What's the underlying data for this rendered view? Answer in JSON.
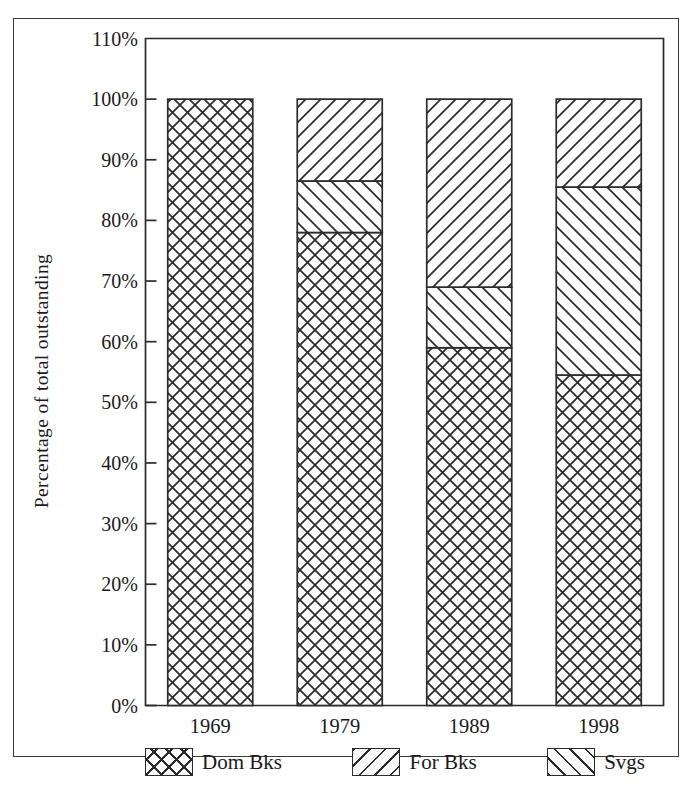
{
  "chart_data": {
    "type": "bar",
    "subtype": "100% stacked column",
    "title": "",
    "xlabel": "",
    "ylabel": "Percentage of total outstanding",
    "categories": [
      "1969",
      "1979",
      "1989",
      "1998"
    ],
    "ylim": [
      0,
      110
    ],
    "ytick_values": [
      0,
      10,
      20,
      30,
      40,
      50,
      60,
      70,
      80,
      90,
      100,
      110
    ],
    "ytick_labels": [
      "0%",
      "10%",
      "20%",
      "30%",
      "40%",
      "50%",
      "60%",
      "70%",
      "80%",
      "90%",
      "100%",
      "110%"
    ],
    "grid": false,
    "legend_position": "bottom",
    "stack_order_bottom_to_top": [
      "Dom Bks",
      "For Bks",
      "Svgs"
    ],
    "series": [
      {
        "name": "Dom Bks",
        "pattern": "crosshatch",
        "values": [
          100,
          78,
          59,
          54.5
        ]
      },
      {
        "name": "For Bks",
        "pattern": "diagonal-backslash",
        "values": [
          0,
          8.5,
          10,
          31
        ]
      },
      {
        "name": "Svgs",
        "pattern": "diagonal-slash",
        "values": [
          0,
          13.5,
          31,
          14.5
        ]
      }
    ],
    "cumulative_tops": {
      "1969": {
        "Dom Bks": 100,
        "For Bks": 100,
        "Svgs": 100
      },
      "1979": {
        "Dom Bks": 78,
        "For Bks": 86.5,
        "Svgs": 100
      },
      "1989": {
        "Dom Bks": 59,
        "For Bks": 69,
        "Svgs": 100
      },
      "1998": {
        "Dom Bks": 54.5,
        "For Bks": 85.5,
        "Svgs": 100
      }
    },
    "colors": {
      "line": "#2b2b2b",
      "fill": "#fdfdfd",
      "frame": "#3a3a3a",
      "text": "#1a1a1a"
    }
  },
  "legend": {
    "entries": [
      {
        "label": "Dom Bks",
        "icon": "crosshatch-swatch"
      },
      {
        "label": "For Bks",
        "icon": "backslash-hatch-swatch"
      },
      {
        "label": "Svgs",
        "icon": "slash-hatch-swatch"
      }
    ]
  }
}
